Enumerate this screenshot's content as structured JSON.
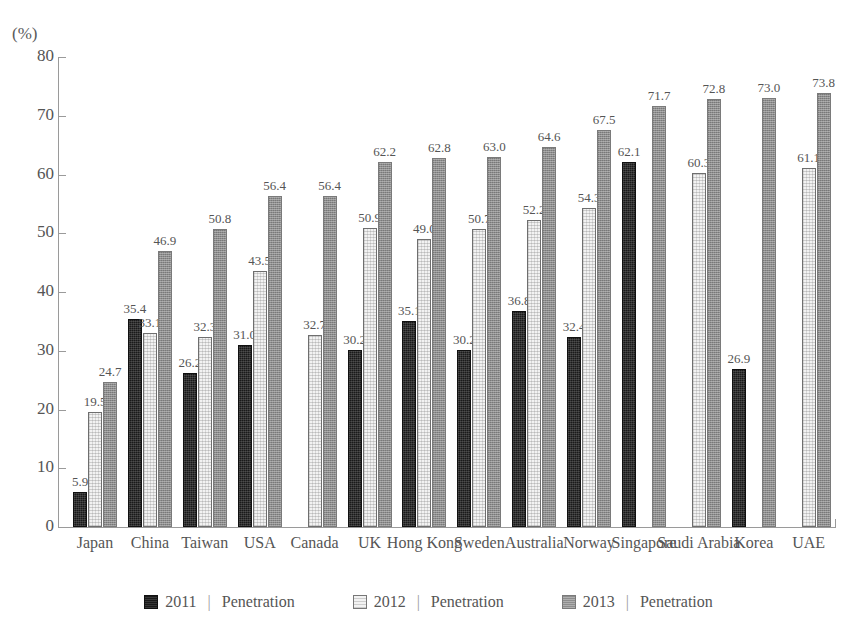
{
  "chart_data": {
    "type": "bar",
    "title": "",
    "subtitle": "",
    "xlabel": "",
    "ylabel": "",
    "unit_label": "(%)",
    "ylim": [
      0,
      80
    ],
    "yticks": [
      80,
      70,
      60,
      50,
      40,
      30,
      20,
      10,
      0
    ],
    "ytick_labels": [
      "80",
      "70",
      "60",
      "50",
      "40",
      "30",
      "20",
      "10",
      "0"
    ],
    "grid": false,
    "legend_position": "bottom",
    "categories": [
      "Japan",
      "China",
      "Taiwan",
      "USA",
      "Canada",
      "UK",
      "Hong Kong",
      "Sweden",
      "Australia",
      "Norway",
      "Singapore",
      "Saudi Arabia",
      "Korea",
      "UAE"
    ],
    "series": [
      {
        "name": "2011",
        "legend_label": "2011",
        "legend_suffix": "Penetration",
        "color": "#1a1a1a",
        "values": [
          5.9,
          35.4,
          26.2,
          31.0,
          null,
          30.2,
          35.1,
          30.2,
          36.8,
          32.4,
          62.1,
          null,
          26.9,
          null
        ]
      },
      {
        "name": "2012",
        "legend_label": "2012",
        "legend_suffix": "Penetration",
        "color": "#f2f2f2",
        "values": [
          19.5,
          33.1,
          32.3,
          43.5,
          32.7,
          50.9,
          49.0,
          50.7,
          52.2,
          54.3,
          null,
          60.3,
          null,
          61.1
        ]
      },
      {
        "name": "2013",
        "legend_label": "2013",
        "legend_suffix": "Penetration",
        "color": "#8d8d8d",
        "values": [
          24.7,
          46.9,
          50.8,
          56.4,
          56.4,
          62.2,
          62.8,
          63.0,
          64.6,
          67.5,
          71.7,
          72.8,
          73.0,
          73.8
        ]
      }
    ],
    "data_labels": {
      "Japan": {
        "2011": "5.9",
        "2012": "19.5",
        "2013": "24.7"
      },
      "China": {
        "2011": "35.4",
        "2012": "33.1",
        "2013": "46.9"
      },
      "Taiwan": {
        "2011": "26.2",
        "2012": "32.3",
        "2013": "50.8"
      },
      "USA": {
        "2011": "31.0",
        "2012": "43.5",
        "2013": "56.4"
      },
      "Canada": {
        "2012": "32.7",
        "2013": "56.4"
      },
      "UK": {
        "2011": "30.2",
        "2012": "50.9",
        "2013": "62.2"
      },
      "Hong Kong": {
        "2011": "35.1",
        "2012": "49.0",
        "2013": "62.8"
      },
      "Sweden": {
        "2011": "30.2",
        "2012": "50.7",
        "2013": "63.0"
      },
      "Australia": {
        "2011": "36.8",
        "2012": "52.2",
        "2013": "64.6"
      },
      "Norway": {
        "2011": "32.4",
        "2012": "54.3",
        "2013": "67.5"
      },
      "Singapore": {
        "2011": "62.1",
        "2013": "71.7"
      },
      "Saudi Arabia": {
        "2012": "60.3",
        "2013": "72.8"
      },
      "Korea": {
        "2011": "26.9",
        "2013": "73.0"
      },
      "UAE": {
        "2012": "61.1",
        "2013": "73.8"
      }
    },
    "legend_separator": "|"
  }
}
